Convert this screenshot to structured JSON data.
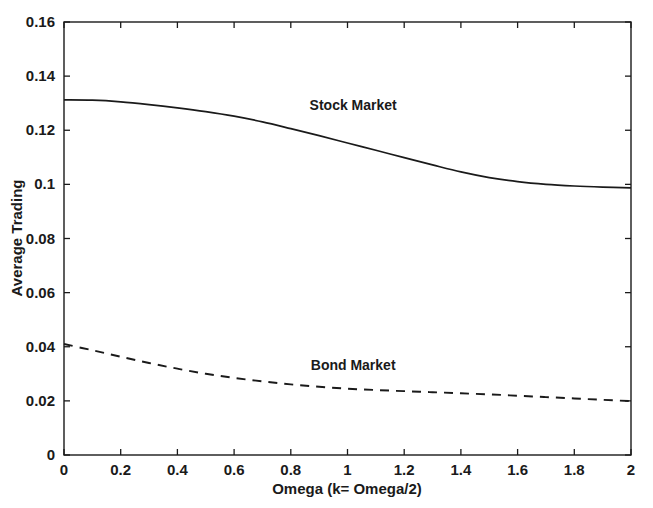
{
  "chart_data": {
    "type": "line",
    "title": "",
    "xlabel": "Omega (k= Omega/2)",
    "ylabel": "Average Trading",
    "xlim": [
      0,
      2
    ],
    "ylim": [
      0,
      0.16
    ],
    "grid": false,
    "legend_position": "inline-annotation",
    "xticks": [
      "0",
      "0.2",
      "0.4",
      "0.6",
      "0.8",
      "1",
      "1.2",
      "1.4",
      "1.6",
      "1.8",
      "2"
    ],
    "xtick_values": [
      0,
      0.2,
      0.4,
      0.6,
      0.8,
      1,
      1.2,
      1.4,
      1.6,
      1.8,
      2
    ],
    "yticks": [
      "0",
      "0.02",
      "0.04",
      "0.06",
      "0.08",
      "0.1",
      "0.12",
      "0.14",
      "0.16"
    ],
    "ytick_values": [
      0,
      0.02,
      0.04,
      0.06,
      0.08,
      0.1,
      0.12,
      0.14,
      0.16
    ],
    "x": [
      0,
      0.1,
      0.2,
      0.3,
      0.4,
      0.5,
      0.6,
      0.7,
      0.8,
      0.9,
      1.0,
      1.1,
      1.2,
      1.3,
      1.4,
      1.5,
      1.6,
      1.7,
      1.8,
      1.9,
      2.0
    ],
    "series": [
      {
        "name": "Stock Market",
        "style": "solid",
        "color": "#1a1a1a",
        "annotation": "Stock Market",
        "annotation_x": 1.02,
        "annotation_y": 0.1275,
        "values": [
          0.1312,
          0.1311,
          0.1305,
          0.1295,
          0.1283,
          0.1269,
          0.1252,
          0.1231,
          0.1206,
          0.118,
          0.1153,
          0.1126,
          0.1099,
          0.1072,
          0.1046,
          0.1025,
          0.101,
          0.1,
          0.0994,
          0.099,
          0.0987
        ]
      },
      {
        "name": "Bond Market",
        "style": "dashed",
        "color": "#1a1a1a",
        "annotation": "Bond Market",
        "annotation_x": 1.02,
        "annotation_y": 0.0315,
        "values": [
          0.041,
          0.0387,
          0.0363,
          0.034,
          0.0319,
          0.03,
          0.0285,
          0.0272,
          0.0261,
          0.0252,
          0.0245,
          0.024,
          0.0236,
          0.0232,
          0.0228,
          0.0224,
          0.0219,
          0.0214,
          0.0209,
          0.0204,
          0.0199
        ]
      }
    ]
  },
  "axes": {
    "x_label": "Omega (k= Omega/2)",
    "y_label": "Average Trading"
  }
}
